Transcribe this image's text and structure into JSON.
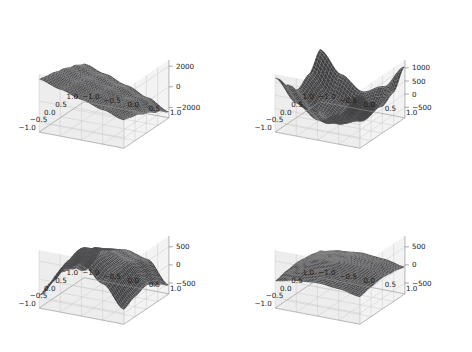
{
  "figure": {
    "background": "#ffffff",
    "width": 472,
    "height": 352,
    "layout": "2x2 grid of 3D surface subplots",
    "surface_color": "#4d4d4d",
    "pane_color": "#f2f2f2",
    "grid_color": "#c8c8c8",
    "tick_label_color": "#1a1a1a"
  },
  "chart_data": [
    {
      "type": "surface",
      "id": "subplot-top-left",
      "position": "top-left",
      "title": "",
      "xlabel": "",
      "ylabel": "",
      "zlabel": "",
      "xlim": [
        -1.0,
        1.0
      ],
      "ylim": [
        -1.0,
        1.0
      ],
      "zlim": [
        -3000,
        2600
      ],
      "xticks": [
        "-1.0",
        "-0.5",
        "0.0",
        "0.5",
        "1.0"
      ],
      "yticks": [
        "-1.0",
        "-0.5",
        "0.0",
        "0.5",
        "1.0"
      ],
      "zticks": [
        "2000",
        "0",
        "-2000"
      ],
      "ztick_values": [
        2000,
        0,
        -2000
      ],
      "grid": true,
      "legend": "none",
      "shape_description": "near-planar tilted sheet, monotone ramp descending from high at x=-1 to low at x=+1",
      "z_samples": [
        [
          2100,
          1500,
          900,
          300,
          -300
        ],
        [
          1900,
          1300,
          700,
          100,
          -600
        ],
        [
          1600,
          1000,
          400,
          -200,
          -1100
        ],
        [
          1200,
          600,
          0,
          -700,
          -1700
        ],
        [
          700,
          100,
          -600,
          -1400,
          -2400
        ]
      ]
    },
    {
      "type": "surface",
      "id": "subplot-top-right",
      "position": "top-right",
      "title": "",
      "xlabel": "",
      "ylabel": "",
      "zlabel": "",
      "xlim": [
        -1.0,
        1.0
      ],
      "ylim": [
        -1.0,
        1.0
      ],
      "zlim": [
        -900,
        1300
      ],
      "xticks": [
        "-1.0",
        "-0.5",
        "0.0",
        "0.5",
        "1.0"
      ],
      "yticks": [
        "-1.0",
        "-0.5",
        "0.0",
        "0.5",
        "1.0"
      ],
      "zticks": [
        "1000",
        "500",
        "0",
        "-500"
      ],
      "ztick_values": [
        1000,
        500,
        0,
        -500
      ],
      "grid": true,
      "legend": "none",
      "shape_description": "deep curved valley / saddle; high ridges at the two far corners, deep trough through the centre-front",
      "z_samples": [
        [
          1150,
          350,
          -150,
          200,
          1100
        ],
        [
          600,
          -150,
          -550,
          -200,
          550
        ],
        [
          150,
          -550,
          -850,
          -600,
          100
        ],
        [
          450,
          -300,
          -700,
          -400,
          350
        ],
        [
          1100,
          300,
          -200,
          150,
          1050
        ]
      ]
    },
    {
      "type": "surface",
      "id": "subplot-bottom-left",
      "position": "bottom-left",
      "title": "",
      "xlabel": "",
      "ylabel": "",
      "zlabel": "",
      "xlim": [
        -1.0,
        1.0
      ],
      "ylim": [
        -1.0,
        1.0
      ],
      "zlim": [
        -800,
        800
      ],
      "xticks": [
        "-1.0",
        "-0.5",
        "0.0",
        "0.5",
        "1.0"
      ],
      "yticks": [
        "-1.0",
        "-0.5",
        "0.0",
        "0.5",
        "1.0"
      ],
      "zticks": [
        "500",
        "0",
        "-500"
      ],
      "ztick_values": [
        500,
        0,
        -500
      ],
      "grid": true,
      "legend": "none",
      "shape_description": "double-wave surface: two tall peaks with a deep trough between them, sinusoidal along x",
      "z_samples": [
        [
          -450,
          300,
          650,
          200,
          -400
        ],
        [
          -300,
          450,
          700,
          350,
          -250
        ],
        [
          -100,
          550,
          600,
          400,
          -150
        ],
        [
          -350,
          350,
          400,
          250,
          -350
        ],
        [
          -600,
          100,
          200,
          50,
          -550
        ]
      ]
    },
    {
      "type": "surface",
      "id": "subplot-bottom-right",
      "position": "bottom-right",
      "title": "",
      "xlabel": "",
      "ylabel": "",
      "zlabel": "",
      "xlim": [
        -1.0,
        1.0
      ],
      "ylim": [
        -1.0,
        1.0
      ],
      "zlim": [
        -800,
        800
      ],
      "xticks": [
        "-1.0",
        "-0.5",
        "0.0",
        "0.5",
        "1.0"
      ],
      "yticks": [
        "-1.0",
        "-0.5",
        "0.0",
        "0.5",
        "1.0"
      ],
      "zticks": [
        "500",
        "0",
        "-500"
      ],
      "ztick_values": [
        500,
        0,
        -500
      ],
      "grid": true,
      "legend": "none",
      "shape_description": "broad flat lens-shaped surface close to z=0, gently domed with edges curling down",
      "z_samples": [
        [
          -50,
          60,
          110,
          60,
          -50
        ],
        [
          20,
          140,
          200,
          140,
          20
        ],
        [
          60,
          200,
          260,
          200,
          60
        ],
        [
          20,
          140,
          200,
          140,
          20
        ],
        [
          -50,
          60,
          110,
          60,
          -50
        ]
      ]
    }
  ]
}
